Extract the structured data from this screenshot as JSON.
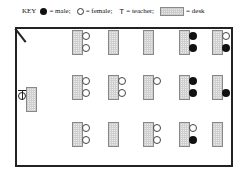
{
  "key": {
    "label": "KEY",
    "male_label": "= male;",
    "female_label": "= female;",
    "teacher_symbol": "T",
    "teacher_label": "= teacher;",
    "desk_label": "= desk"
  },
  "colors": {
    "male": "#111111",
    "female": "#ffffff",
    "desk_fill": "#ececec",
    "wall": "#222222"
  },
  "room": {
    "teacher": {
      "symbol": "T",
      "desk": true
    },
    "rows": [
      {
        "row": 1,
        "desks": [
          {
            "col": 1,
            "seats": [
              "female",
              "female"
            ]
          },
          {
            "col": 2,
            "seats": []
          },
          {
            "col": 3,
            "seats": []
          },
          {
            "col": 4,
            "seats": [
              "male",
              "male"
            ]
          },
          {
            "col": 5,
            "seats": [
              "female",
              "male"
            ]
          }
        ]
      },
      {
        "row": 2,
        "desks": [
          {
            "col": 1,
            "seats": [
              "female",
              "female"
            ]
          },
          {
            "col": 2,
            "seats": [
              "female",
              "female"
            ]
          },
          {
            "col": 3,
            "seats": [
              "female",
              null
            ]
          },
          {
            "col": 4,
            "seats": [
              "male",
              "male"
            ]
          },
          {
            "col": 5,
            "seats": [
              null,
              "male"
            ]
          }
        ]
      },
      {
        "row": 3,
        "desks": [
          {
            "col": 1,
            "seats": [
              "female",
              "female"
            ]
          },
          {
            "col": 2,
            "seats": []
          },
          {
            "col": 3,
            "seats": [
              "female",
              "female"
            ]
          },
          {
            "col": 4,
            "seats": [
              "female",
              "male"
            ]
          },
          {
            "col": 5,
            "seats": []
          }
        ]
      }
    ]
  }
}
